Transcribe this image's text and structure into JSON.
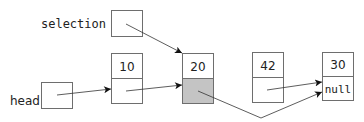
{
  "diagram": {
    "type": "linked-list",
    "pointers": [
      {
        "label": "selection",
        "points_to": "node-20"
      },
      {
        "label": "head",
        "points_to": "node-10"
      }
    ],
    "nodes": [
      {
        "id": "node-10",
        "value": "10",
        "next": "node-20",
        "highlighted": false
      },
      {
        "id": "node-20",
        "value": "20",
        "next": "node-30",
        "highlighted": true
      },
      {
        "id": "node-42",
        "value": "42",
        "next": "node-30",
        "highlighted": false
      },
      {
        "id": "node-30",
        "value": "30",
        "next_label": "null",
        "highlighted": false
      }
    ],
    "colors": {
      "highlight_fill": "#c4c4c4",
      "stroke": "#6e6e6e"
    }
  }
}
